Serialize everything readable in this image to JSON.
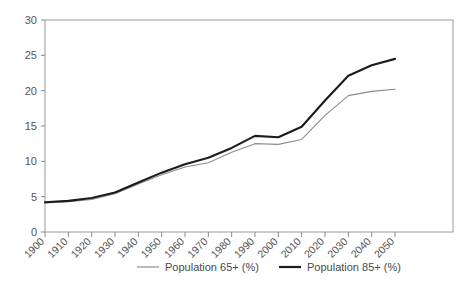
{
  "chart_data": {
    "type": "line",
    "title": "",
    "subtitle": "",
    "xlabel": "",
    "ylabel": "",
    "grid": false,
    "legend_position": "bottom",
    "x": [
      1900,
      1910,
      1920,
      1930,
      1940,
      1950,
      1960,
      1970,
      1980,
      1990,
      2000,
      2010,
      2020,
      2030,
      2040,
      2050
    ],
    "categories": [
      "1900",
      "1910",
      "1920",
      "1930",
      "1940",
      "1950",
      "1960",
      "1970",
      "1980",
      "1990",
      "2000",
      "2010",
      "2020",
      "2030",
      "2040",
      "2050"
    ],
    "xlim": [
      1900,
      2050
    ],
    "ylim": [
      0,
      30
    ],
    "yticks": [
      0,
      5,
      10,
      15,
      20,
      25,
      30
    ],
    "ytick_labels": [
      "0",
      "5",
      "10",
      "15",
      "20",
      "25",
      "30"
    ],
    "series": [
      {
        "name": "Population 65+ (%)",
        "color": "#8c8c8c",
        "width": 1.1,
        "values": [
          4.1,
          4.3,
          4.6,
          5.4,
          6.8,
          8.1,
          9.2,
          9.8,
          11.3,
          12.5,
          12.4,
          13.1,
          16.5,
          19.3,
          19.9,
          20.2
        ]
      },
      {
        "name": "Population 85+ (%)",
        "color": "#1c1c1c",
        "width": 2.1,
        "values": [
          4.2,
          4.4,
          4.8,
          5.6,
          7.0,
          8.4,
          9.6,
          10.5,
          11.9,
          13.6,
          13.4,
          14.9,
          18.6,
          22.1,
          23.6,
          24.5
        ]
      }
    ]
  },
  "legend": {
    "items": [
      {
        "label": "Population 65+ (%)",
        "color": "#8c8c8c",
        "width": 1.2
      },
      {
        "label": "Population 85+ (%)",
        "color": "#1c1c1c",
        "width": 2.2
      }
    ]
  },
  "axes": {
    "frame_color": "#9a9a9a",
    "tick_color": "#8a8a8a",
    "label_color": "#555555"
  }
}
